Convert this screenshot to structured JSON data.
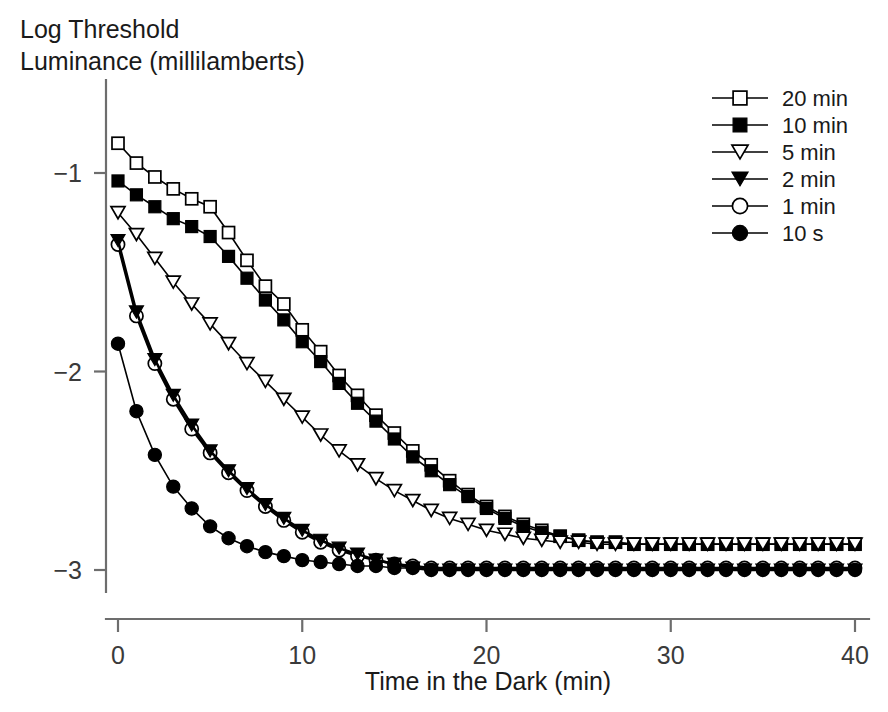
{
  "chart_data": {
    "type": "line",
    "title": "",
    "xlabel": "Time in the Dark (min)",
    "ylabel": "Log Threshold Luminance (millilamberts)",
    "ylabel_line1": "Log Threshold",
    "ylabel_line2": "Luminance (millilamberts)",
    "xlim": [
      0,
      40
    ],
    "ylim": [
      -3.15,
      -0.55
    ],
    "xticks": [
      0,
      10,
      20,
      30,
      40
    ],
    "xtick_labels": [
      "0",
      "10",
      "20",
      "30",
      "40"
    ],
    "yticks": [
      -1,
      -2,
      -3
    ],
    "ytick_labels": [
      "−1",
      "−2",
      "−3"
    ],
    "grid": false,
    "legend_position": "top-right",
    "x": [
      0,
      1,
      2,
      3,
      4,
      5,
      6,
      7,
      8,
      9,
      10,
      11,
      12,
      13,
      14,
      15,
      16,
      17,
      18,
      19,
      20,
      21,
      22,
      23,
      24,
      25,
      26,
      27,
      28,
      29,
      30,
      31,
      32,
      33,
      34,
      35,
      36,
      37,
      38,
      39,
      40
    ],
    "series": [
      {
        "name": "20 min",
        "marker": "square-open",
        "marker_fill": "#ffffff",
        "marker_stroke": "#000000",
        "line_color": "#000000",
        "values": [
          -0.85,
          -0.95,
          -1.02,
          -1.08,
          -1.13,
          -1.17,
          -1.3,
          -1.44,
          -1.57,
          -1.66,
          -1.79,
          -1.9,
          -2.02,
          -2.12,
          -2.22,
          -2.31,
          -2.4,
          -2.47,
          -2.55,
          -2.62,
          -2.68,
          -2.73,
          -2.77,
          -2.8,
          -2.83,
          -2.85,
          -2.86,
          -2.86,
          -2.87,
          -2.87,
          -2.87,
          -2.87,
          -2.87,
          -2.87,
          -2.87,
          -2.87,
          -2.87,
          -2.87,
          -2.87,
          -2.87,
          -2.87
        ]
      },
      {
        "name": "10 min",
        "marker": "square-filled",
        "marker_fill": "#000000",
        "marker_stroke": "#000000",
        "line_color": "#000000",
        "values": [
          -1.04,
          -1.11,
          -1.17,
          -1.23,
          -1.27,
          -1.32,
          -1.42,
          -1.53,
          -1.64,
          -1.74,
          -1.85,
          -1.95,
          -2.06,
          -2.16,
          -2.25,
          -2.34,
          -2.43,
          -2.5,
          -2.57,
          -2.63,
          -2.69,
          -2.74,
          -2.78,
          -2.81,
          -2.83,
          -2.85,
          -2.86,
          -2.86,
          -2.87,
          -2.87,
          -2.87,
          -2.87,
          -2.87,
          -2.87,
          -2.87,
          -2.87,
          -2.87,
          -2.87,
          -2.87,
          -2.87,
          -2.87
        ]
      },
      {
        "name": "5 min",
        "marker": "triangle-down-open",
        "marker_fill": "#ffffff",
        "marker_stroke": "#000000",
        "line_color": "#000000",
        "values": [
          -1.2,
          -1.31,
          -1.43,
          -1.55,
          -1.66,
          -1.76,
          -1.86,
          -1.96,
          -2.05,
          -2.14,
          -2.23,
          -2.32,
          -2.4,
          -2.47,
          -2.54,
          -2.6,
          -2.65,
          -2.7,
          -2.74,
          -2.77,
          -2.8,
          -2.82,
          -2.84,
          -2.85,
          -2.86,
          -2.86,
          -2.87,
          -2.87,
          -2.87,
          -2.87,
          -2.87,
          -2.87,
          -2.87,
          -2.87,
          -2.87,
          -2.87,
          -2.87,
          -2.87,
          -2.87,
          -2.87,
          -2.87
        ]
      },
      {
        "name": "2 min",
        "marker": "triangle-down-filled",
        "marker_fill": "#000000",
        "marker_stroke": "#000000",
        "line_color": "#000000",
        "values": [
          -1.34,
          -1.7,
          -1.94,
          -2.12,
          -2.27,
          -2.4,
          -2.5,
          -2.59,
          -2.67,
          -2.74,
          -2.8,
          -2.85,
          -2.89,
          -2.92,
          -2.95,
          -2.97,
          -2.99,
          -3.0,
          -3.0,
          -3.0,
          -3.0,
          -3.0,
          -3.0,
          -3.0,
          -3.0,
          -3.0,
          -3.0,
          -3.0,
          -3.0,
          -3.0,
          -3.0,
          -3.0,
          -3.0,
          -3.0,
          -3.0,
          -3.0,
          -3.0,
          -3.0,
          -3.0,
          -3.0,
          -3.0
        ]
      },
      {
        "name": "1 min",
        "marker": "circle-open",
        "marker_fill": "#ffffff",
        "marker_stroke": "#000000",
        "line_color": "#000000",
        "values": [
          -1.36,
          -1.72,
          -1.96,
          -2.14,
          -2.29,
          -2.41,
          -2.51,
          -2.6,
          -2.68,
          -2.75,
          -2.81,
          -2.86,
          -2.9,
          -2.93,
          -2.95,
          -2.97,
          -2.98,
          -2.99,
          -2.99,
          -2.99,
          -2.99,
          -2.99,
          -2.99,
          -2.99,
          -2.99,
          -2.99,
          -2.99,
          -2.99,
          -2.99,
          -2.99,
          -2.99,
          -2.99,
          -2.99,
          -2.99,
          -2.99,
          -2.99,
          -2.99,
          -2.99,
          -2.99,
          -2.99,
          -2.99
        ]
      },
      {
        "name": "10 s",
        "marker": "circle-filled",
        "marker_fill": "#000000",
        "marker_stroke": "#000000",
        "line_color": "#000000",
        "values": [
          -1.86,
          -2.2,
          -2.42,
          -2.58,
          -2.69,
          -2.78,
          -2.84,
          -2.88,
          -2.91,
          -2.93,
          -2.95,
          -2.96,
          -2.97,
          -2.98,
          -2.98,
          -2.99,
          -2.99,
          -3.0,
          -3.0,
          -3.0,
          -3.0,
          -3.0,
          -3.0,
          -3.0,
          -3.0,
          -3.0,
          -3.0,
          -3.0,
          -3.0,
          -3.0,
          -3.0,
          -3.0,
          -3.0,
          -3.0,
          -3.0,
          -3.0,
          -3.0,
          -3.0,
          -3.0,
          -3.0,
          -3.0
        ]
      }
    ]
  },
  "legend": {
    "items": [
      {
        "label": "20 min",
        "marker": "square-open"
      },
      {
        "label": "10 min",
        "marker": "square-filled"
      },
      {
        "label": "5 min",
        "marker": "triangle-down-open"
      },
      {
        "label": "2 min",
        "marker": "triangle-down-filled"
      },
      {
        "label": "1 min",
        "marker": "circle-open"
      },
      {
        "label": "10 s",
        "marker": "circle-filled"
      }
    ]
  },
  "colors": {
    "background": "#ffffff",
    "axis": "#6d6d6d",
    "ink": "#000000",
    "text": "#1a1a1a"
  }
}
